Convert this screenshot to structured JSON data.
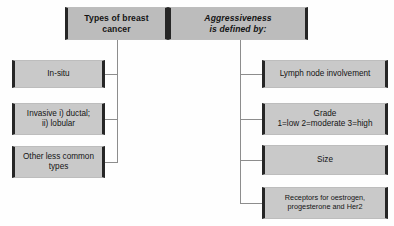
{
  "diagram": {
    "title_left": "Types of breast\ncancer",
    "title_right": "Aggressiveness\nis defined by:",
    "left_branch": {
      "items": [
        {
          "text": "In-situ"
        },
        {
          "text": "Invasive i) ductal;\nii) lobular"
        },
        {
          "text": "Other less common\ntypes"
        }
      ]
    },
    "right_branch": {
      "items": [
        {
          "text": "Lymph node involvement"
        },
        {
          "text": "Grade\n1=low 2=moderate 3=high"
        },
        {
          "text": "Size"
        },
        {
          "text": "Receptors for oestrogen,\nprogesterone and Her2"
        }
      ]
    },
    "colors": {
      "node_fill": "#c6c6c6",
      "header_fill": "#bcbcbc",
      "edge_bar": "#262626",
      "wire": "#8d8d8d",
      "text": "#141414",
      "background": "#fefefe"
    }
  }
}
